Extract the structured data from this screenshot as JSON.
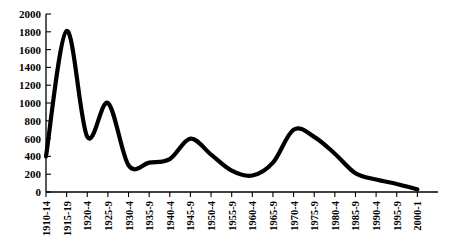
{
  "chart_data": {
    "type": "line",
    "title": "",
    "subtitle": "",
    "xlabel": "",
    "ylabel": "",
    "grid": false,
    "legend": false,
    "legend_position": "none",
    "xlim_categories": 20,
    "ylim": [
      0,
      2000
    ],
    "ytick_step": 200,
    "yticks": [
      0,
      200,
      400,
      600,
      800,
      1000,
      1200,
      1400,
      1600,
      1800,
      2000
    ],
    "ytick_labels": [
      "0",
      "200",
      "400",
      "600",
      "800",
      "1000",
      "1200",
      "1400",
      "1600",
      "1800",
      "2000"
    ],
    "categories": [
      "1910-14",
      "1915-19",
      "1920-4",
      "1925-9",
      "1930-4",
      "1935-9",
      "1940-4",
      "1945-9",
      "1950-4",
      "1955-9",
      "1960-4",
      "1965-9",
      "1970-4",
      "1975-9",
      "1980-4",
      "1985-9",
      "1990-4",
      "1995-9",
      "2000-1"
    ],
    "series": [
      {
        "name": "series-1",
        "color": "#000000",
        "values": [
          400,
          1810,
          620,
          1000,
          300,
          330,
          370,
          600,
          420,
          240,
          185,
          330,
          700,
          620,
          430,
          210,
          140,
          90,
          30
        ]
      }
    ],
    "annotations": []
  },
  "style": {
    "line_color": "#000000",
    "axis_color": "#000000",
    "background": "#ffffff"
  }
}
